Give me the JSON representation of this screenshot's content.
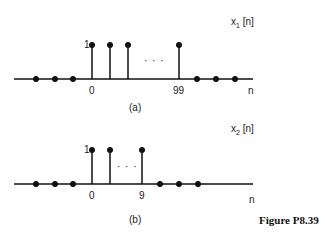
{
  "figure_label": "Figure P8.39",
  "panels": [
    {
      "id": "a",
      "caption": "(a)",
      "signal_label": "x",
      "signal_sub": "1",
      "signal_arg": " [n]",
      "axis_label": "n",
      "amplitude_label": "1",
      "tick_labels": [
        "0",
        "99"
      ],
      "ellipsis": "· · ·",
      "description": "x1[n] = 1 for 0 <= n <= 99, 0 otherwise"
    },
    {
      "id": "b",
      "caption": "(b)",
      "signal_label": "x",
      "signal_sub": "2",
      "signal_arg": " [n]",
      "axis_label": "n",
      "amplitude_label": "1",
      "tick_labels": [
        "0",
        "9"
      ],
      "ellipsis": "· · ·",
      "description": "x2[n] = 1 for 0 <= n <= 9, 0 otherwise"
    }
  ]
}
